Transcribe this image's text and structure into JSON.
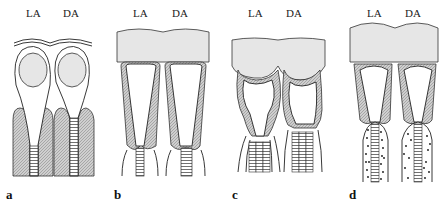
{
  "figure": {
    "panels": [
      {
        "id": "a",
        "label": "a",
        "columns": [
          "LA",
          "DA"
        ]
      },
      {
        "id": "b",
        "label": "b",
        "columns": [
          "LA",
          "DA"
        ]
      },
      {
        "id": "c",
        "label": "c",
        "columns": [
          "LA",
          "DA"
        ]
      },
      {
        "id": "d",
        "label": "d",
        "columns": [
          "LA",
          "DA"
        ]
      }
    ]
  },
  "colors": {
    "cap_fill": "#e6e6e6",
    "hatched_fill": "#bdbdbd",
    "stroke": "#222222"
  }
}
